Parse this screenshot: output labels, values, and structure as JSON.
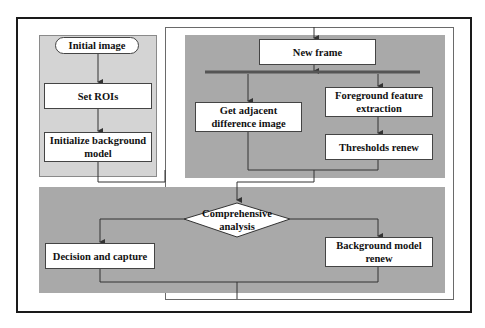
{
  "diagram": {
    "nodes": {
      "initial_image": "Initial image",
      "set_rois": "Set ROIs",
      "init_bg_model": "Initialize background model",
      "new_frame": "New frame",
      "adjacent_diff": "Get adjacent difference image",
      "fg_feature": "Foreground feature extraction",
      "thresholds_renew": "Thresholds renew",
      "comprehensive": "Comprehensive analysis",
      "decision_capture": "Decision and capture",
      "bg_model_renew": "Background model renew"
    },
    "colors": {
      "light_panel": "#d4d4d4",
      "dark_panel": "#a9a9a9",
      "line": "#333333",
      "border": "#1a1a1a"
    }
  }
}
